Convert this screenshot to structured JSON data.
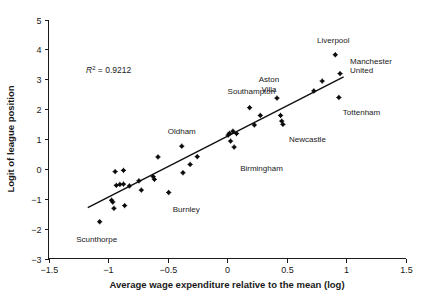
{
  "chart_data": {
    "type": "scatter",
    "title": "",
    "xlabel": "Average wage expenditure relative to the mean (log)",
    "ylabel": "Logit of league position",
    "xlim": [
      -1.5,
      1.5
    ],
    "ylim": [
      -3,
      5
    ],
    "xticks": [
      "-1.5",
      "-1",
      "-0.5",
      "0",
      "0.5",
      "1",
      "1.5"
    ],
    "xtick_values": [
      -1.5,
      -1,
      -0.5,
      0,
      0.5,
      1,
      1.5
    ],
    "yticks": [
      "5",
      "4",
      "3",
      "2",
      "1",
      "0",
      "-1",
      "-2",
      "-3"
    ],
    "ytick_values": [
      5,
      4,
      3,
      2,
      1,
      0,
      -1,
      -2,
      -3
    ],
    "grid": false,
    "legend": "none",
    "annotations": [
      {
        "text": "R",
        "sup": "2",
        "rest": " = 0.9212",
        "full": "R2 = 0.9212",
        "x": -1.0,
        "y": 3.05
      }
    ],
    "trendline": {
      "type": "linear",
      "x_start": -1.17,
      "y_start": -1.3,
      "x_end": 0.98,
      "y_end": 3.08,
      "r_squared": 0.9212
    },
    "points": [
      {
        "x": -1.07,
        "y": -1.77,
        "label": "Scunthorpe",
        "label_dx": -3,
        "label_dy": 20
      },
      {
        "x": -0.97,
        "y": -1.05,
        "label": ""
      },
      {
        "x": -0.96,
        "y": -1.11,
        "label": ""
      },
      {
        "x": -0.95,
        "y": -1.32,
        "label": ""
      },
      {
        "x": -0.94,
        "y": -0.09,
        "label": ""
      },
      {
        "x": -0.93,
        "y": -0.55,
        "label": ""
      },
      {
        "x": -0.9,
        "y": -0.52,
        "label": ""
      },
      {
        "x": -0.87,
        "y": -0.05,
        "label": ""
      },
      {
        "x": -0.87,
        "y": -0.51,
        "label": ""
      },
      {
        "x": -0.86,
        "y": -1.23,
        "label": ""
      },
      {
        "x": -0.82,
        "y": -0.57,
        "label": ""
      },
      {
        "x": -0.74,
        "y": -0.4,
        "label": ""
      },
      {
        "x": -0.72,
        "y": -0.71,
        "label": ""
      },
      {
        "x": -0.62,
        "y": -0.26,
        "label": ""
      },
      {
        "x": -0.61,
        "y": -0.35,
        "label": ""
      },
      {
        "x": -0.58,
        "y": 0.4,
        "label": ""
      },
      {
        "x": -0.49,
        "y": -0.79,
        "label": "Burnley",
        "label_dx": 4,
        "label_dy": 20
      },
      {
        "x": -0.38,
        "y": 0.76,
        "label": "Oldham",
        "label_dx": 0,
        "label_dy": -12
      },
      {
        "x": -0.37,
        "y": -0.13,
        "label": ""
      },
      {
        "x": -0.31,
        "y": 0.15,
        "label": ""
      },
      {
        "x": -0.25,
        "y": 0.41,
        "label": ""
      },
      {
        "x": 0.01,
        "y": 1.13,
        "label": ""
      },
      {
        "x": 0.02,
        "y": 1.19,
        "label": ""
      },
      {
        "x": 0.03,
        "y": 0.93,
        "label": ""
      },
      {
        "x": 0.05,
        "y": 1.26,
        "label": ""
      },
      {
        "x": 0.06,
        "y": 0.73,
        "label": "Birmingham",
        "label_dx": 6,
        "label_dy": 24
      },
      {
        "x": 0.08,
        "y": 1.18,
        "label": ""
      },
      {
        "x": 0.19,
        "y": 2.05,
        "label": "Southampton",
        "label_dx": -22,
        "label_dy": -14
      },
      {
        "x": 0.23,
        "y": 1.47,
        "label": ""
      },
      {
        "x": 0.28,
        "y": 1.79,
        "label": ""
      },
      {
        "x": 0.42,
        "y": 2.37,
        "label": "Aston Villa",
        "label_dx": -8,
        "label_dy": -16
      },
      {
        "x": 0.45,
        "y": 1.79,
        "label": ""
      },
      {
        "x": 0.46,
        "y": 1.6,
        "label": ""
      },
      {
        "x": 0.47,
        "y": 1.49,
        "label": "Newcastle",
        "label_dx": 6,
        "label_dy": 18
      },
      {
        "x": 0.73,
        "y": 2.61,
        "label": ""
      },
      {
        "x": 0.8,
        "y": 2.94,
        "label": ""
      },
      {
        "x": 0.91,
        "y": 3.82,
        "label": "Liverpool",
        "label_dx": -2,
        "label_dy": -12
      },
      {
        "x": 0.94,
        "y": 2.39,
        "label": "Tottenham",
        "label_dx": 4,
        "label_dy": 18
      },
      {
        "x": 0.95,
        "y": 3.19,
        "label": "Manchester United",
        "label_dx": 10,
        "label_dy": -10
      }
    ]
  },
  "axes": {
    "x_title": "Average wage expenditure relative to the mean (log)",
    "y_title": "Logit of league position"
  },
  "labels": {
    "r2_prefix": "R",
    "r2_exponent": "2",
    "r2_value": " = 0.9212",
    "scunthorpe": "Scunthorpe",
    "burnley": "Burnley",
    "oldham": "Oldham",
    "birmingham": "Birmingham",
    "southampton": "Southampton",
    "aston_villa_line1": "Aston",
    "aston_villa_line2": "Villa",
    "newcastle": "Newcastle",
    "liverpool": "Liverpool",
    "tottenham": "Tottenham",
    "manchester_line1": "Manchester",
    "manchester_line2": "United"
  },
  "colors": {
    "point": "#0d0d0d",
    "line": "#101010",
    "axis": "#1a1a1a",
    "background": "#ffffff"
  }
}
